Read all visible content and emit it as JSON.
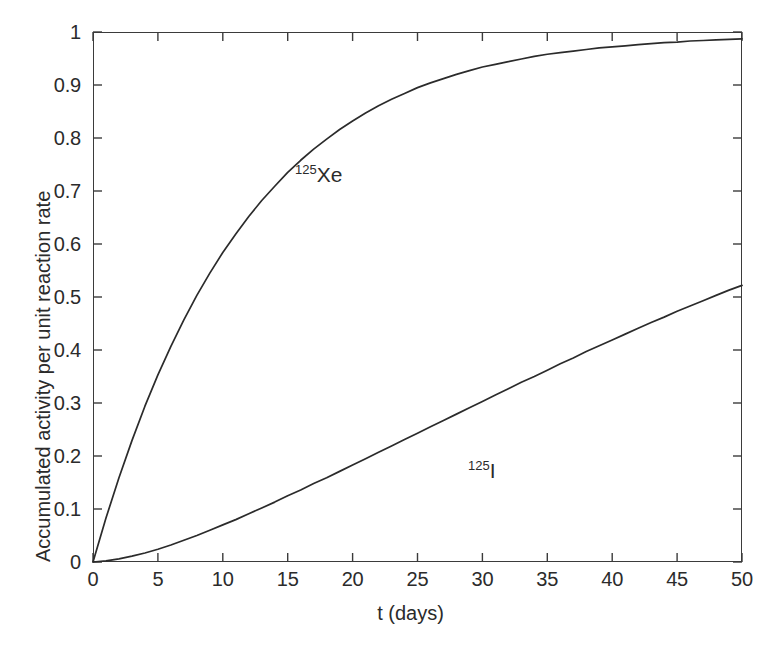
{
  "figure": {
    "background_color": "#ffffff",
    "foreground_color": "#2b2b2b",
    "axis_color": "#3b3b3b",
    "curve_color": "#2b2b2b"
  },
  "axes": {
    "x_title": "t (days)",
    "y_title": "Accumulated activity per unit reaction rate",
    "x_ticks": [
      "0",
      "5",
      "10",
      "15",
      "20",
      "25",
      "30",
      "35",
      "40",
      "45",
      "50"
    ],
    "y_ticks": [
      "0",
      "0.1",
      "0.2",
      "0.3",
      "0.4",
      "0.5",
      "0.6",
      "0.7",
      "0.8",
      "0.9",
      "1"
    ]
  },
  "annotations": {
    "xe_sup": "125",
    "xe_sym": "Xe",
    "i_sup": "125",
    "i_sym": "I"
  },
  "chart_data": {
    "type": "line",
    "title": "",
    "subtitle": "",
    "xlabel": "t (days)",
    "ylabel": "Accumulated activity per unit reaction rate",
    "xlim": [
      0,
      50
    ],
    "ylim": [
      0,
      1
    ],
    "xticks": [
      0,
      5,
      10,
      15,
      20,
      25,
      30,
      35,
      40,
      45,
      50
    ],
    "yticks": [
      0,
      0.1,
      0.2,
      0.3,
      0.4,
      0.5,
      0.6,
      0.7,
      0.8,
      0.9,
      1.0
    ],
    "grid": false,
    "legend": "in-plot curve annotations",
    "legend_position": "none",
    "series": [
      {
        "name": "125Xe",
        "label": "¹²⁵Xe",
        "color": "#2b2b2b",
        "x": [
          0,
          1,
          2,
          3,
          4,
          5,
          6,
          7,
          8,
          9,
          10,
          11,
          12,
          13,
          14,
          15,
          16,
          17,
          18,
          19,
          20,
          21,
          22,
          23,
          24,
          25,
          26,
          27,
          28,
          29,
          30,
          31,
          32,
          33,
          34,
          35,
          36,
          37,
          38,
          39,
          40,
          41,
          42,
          43,
          44,
          45,
          46,
          47,
          48,
          49,
          50
        ],
        "y": [
          0.0,
          0.083,
          0.159,
          0.229,
          0.294,
          0.353,
          0.407,
          0.457,
          0.503,
          0.545,
          0.584,
          0.619,
          0.652,
          0.682,
          0.709,
          0.735,
          0.758,
          0.779,
          0.798,
          0.816,
          0.832,
          0.847,
          0.861,
          0.873,
          0.884,
          0.895,
          0.904,
          0.912,
          0.92,
          0.927,
          0.934,
          0.939,
          0.944,
          0.949,
          0.954,
          0.958,
          0.961,
          0.964,
          0.967,
          0.97,
          0.972,
          0.974,
          0.976,
          0.978,
          0.98,
          0.981,
          0.983,
          0.984,
          0.985,
          0.986,
          0.987
        ]
      },
      {
        "name": "125I",
        "label": "¹²⁵I",
        "color": "#2b2b2b",
        "x": [
          0,
          1,
          2,
          3,
          4,
          5,
          6,
          7,
          8,
          9,
          10,
          11,
          12,
          13,
          14,
          15,
          16,
          17,
          18,
          19,
          20,
          21,
          22,
          23,
          24,
          25,
          26,
          27,
          28,
          29,
          30,
          31,
          32,
          33,
          34,
          35,
          36,
          37,
          38,
          39,
          40,
          41,
          42,
          43,
          44,
          45,
          46,
          47,
          48,
          49,
          50
        ],
        "y": [
          0.0,
          0.002,
          0.006,
          0.011,
          0.017,
          0.024,
          0.032,
          0.041,
          0.05,
          0.06,
          0.07,
          0.08,
          0.091,
          0.102,
          0.113,
          0.125,
          0.136,
          0.148,
          0.159,
          0.171,
          0.183,
          0.195,
          0.207,
          0.219,
          0.231,
          0.243,
          0.255,
          0.267,
          0.279,
          0.291,
          0.303,
          0.315,
          0.327,
          0.339,
          0.35,
          0.362,
          0.374,
          0.385,
          0.397,
          0.408,
          0.419,
          0.43,
          0.441,
          0.452,
          0.462,
          0.473,
          0.483,
          0.493,
          0.503,
          0.513,
          0.522
        ]
      }
    ]
  }
}
